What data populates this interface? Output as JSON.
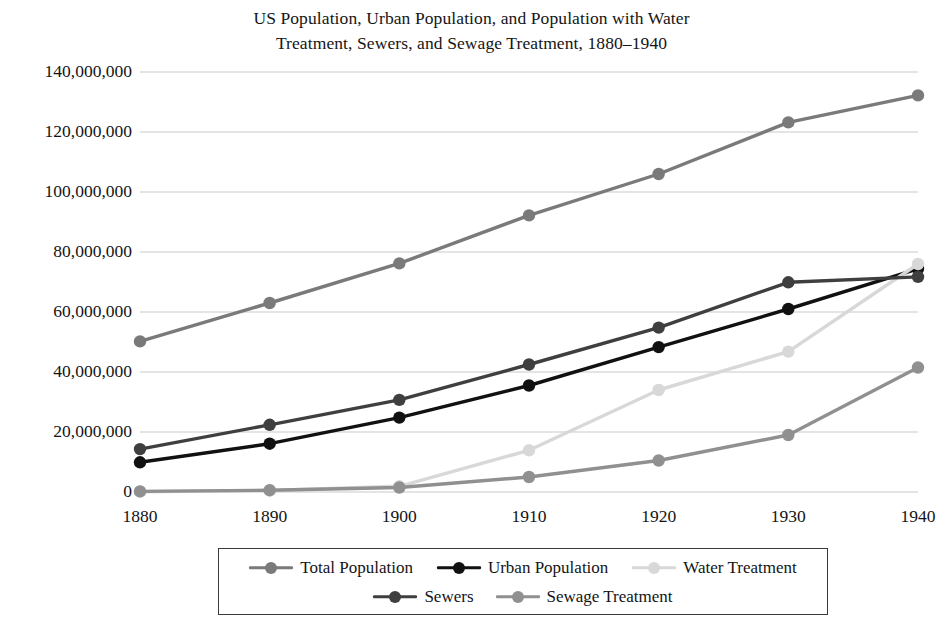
{
  "chart_data": {
    "type": "line",
    "title": "US Population, Urban Population, and Population with Water Treatment, Sewers, and Sewage Treatment, 1880–1940",
    "title_lines": [
      "US Population, Urban Population, and Population with Water",
      "Treatment, Sewers, and Sewage Treatment, 1880–1940"
    ],
    "xlabel": "",
    "ylabel": "",
    "x": [
      1880,
      1890,
      1900,
      1910,
      1920,
      1930,
      1940
    ],
    "categories": [
      "1880",
      "1890",
      "1900",
      "1910",
      "1920",
      "1930",
      "1940"
    ],
    "xlim": [
      1880,
      1940
    ],
    "ylim": [
      0,
      140000000
    ],
    "ytick_values": [
      0,
      20000000,
      40000000,
      60000000,
      80000000,
      100000000,
      120000000,
      140000000
    ],
    "ytick_labels": [
      "0",
      "20,000,000",
      "40,000,000",
      "60,000,000",
      "80,000,000",
      "100,000,000",
      "120,000,000",
      "140,000,000"
    ],
    "grid": true,
    "grid_axis": "y",
    "grid_color": "#c9c9c9",
    "legend_position": "bottom",
    "legend_border_color": "#3a3a3a",
    "background": "#ffffff",
    "series": [
      {
        "name": "Total Population",
        "color": "#7a7a7a",
        "marker": "circle",
        "values": [
          50200000,
          63000000,
          76200000,
          92200000,
          106000000,
          123200000,
          132200000
        ]
      },
      {
        "name": "Urban Population",
        "color": "#111111",
        "marker": "circle",
        "values": [
          9900000,
          16100000,
          24800000,
          35500000,
          48300000,
          61000000,
          74400000
        ]
      },
      {
        "name": "Water Treatment",
        "color": "#d8d8d8",
        "marker": "circle",
        "values": [
          100000,
          500000,
          1900000,
          13900000,
          34000000,
          46800000,
          76000000
        ]
      },
      {
        "name": "Sewers",
        "color": "#3f3f3f",
        "marker": "circle",
        "values": [
          14300000,
          22400000,
          30700000,
          42500000,
          54800000,
          69900000,
          71700000
        ]
      },
      {
        "name": "Sewage Treatment",
        "color": "#909090",
        "marker": "circle",
        "values": [
          200000,
          600000,
          1500000,
          5000000,
          10500000,
          19000000,
          41500000
        ]
      }
    ]
  }
}
